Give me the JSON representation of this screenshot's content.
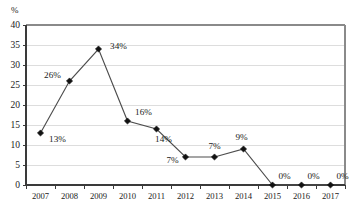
{
  "chart_data": {
    "type": "line",
    "title": "",
    "xlabel": "",
    "ylabel": "%",
    "categories": [
      "2007",
      "2008",
      "2009",
      "2010",
      "2011",
      "2012",
      "2013",
      "2014",
      "2015",
      "2016",
      "2017"
    ],
    "values": [
      13,
      26,
      34,
      16,
      14,
      7,
      7,
      9,
      0,
      0,
      0
    ],
    "point_labels": [
      "13%",
      "26%",
      "34%",
      "16%",
      "14%",
      "7%",
      "7%",
      "9%",
      "0%",
      "0%",
      "0%"
    ],
    "ylim": [
      0,
      40
    ],
    "yticks": [
      0,
      5,
      10,
      15,
      20,
      25,
      30,
      35,
      40
    ],
    "ytick_labels": [
      "0",
      "5",
      "10",
      "15",
      "20",
      "25",
      "30",
      "35",
      "40"
    ],
    "grid": true,
    "legend": "none",
    "series": [
      {
        "name": "",
        "values": [
          13,
          26,
          34,
          16,
          14,
          7,
          7,
          9,
          0,
          0,
          0
        ],
        "marker": "diamond",
        "line_color": "#4d4d4d",
        "marker_color": "#111111"
      }
    ],
    "colors": {
      "line": "#4d4d4d",
      "marker": "#111111",
      "gridline": "#d9d9d9",
      "axis": "#3a3a3a",
      "plot_border": "#8a8a8a",
      "text": "#1a1a1a",
      "background": "#ffffff"
    },
    "label_offsets": [
      {
        "dx": 17,
        "dy": 9
      },
      {
        "dx": -17,
        "dy": -3
      },
      {
        "dx": 20,
        "dy": 0
      },
      {
        "dx": 16,
        "dy": -6
      },
      {
        "dx": 7,
        "dy": 13
      },
      {
        "dx": -13,
        "dy": 6
      },
      {
        "dx": 0,
        "dy": -8
      },
      {
        "dx": -2,
        "dy": -9
      },
      {
        "dx": 12,
        "dy": -6
      },
      {
        "dx": 12,
        "dy": -6
      },
      {
        "dx": 12,
        "dy": -6
      }
    ]
  }
}
